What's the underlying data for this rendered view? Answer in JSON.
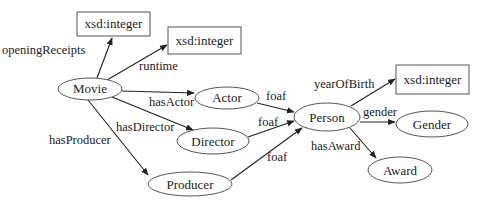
{
  "diagram": {
    "nodes": {
      "xsd1": {
        "label": "xsd:integer",
        "shape": "rect",
        "x": 77,
        "y": 12,
        "w": 73,
        "h": 24
      },
      "xsd2": {
        "label": "xsd:integer",
        "shape": "rect",
        "x": 168,
        "y": 27,
        "w": 73,
        "h": 27
      },
      "movie": {
        "label": "Movie",
        "shape": "ellipse",
        "cx": 90,
        "cy": 89,
        "rx": 32,
        "ry": 11
      },
      "actor": {
        "label": "Actor",
        "shape": "ellipse",
        "cx": 227,
        "cy": 98,
        "rx": 32,
        "ry": 11
      },
      "director": {
        "label": "Director",
        "shape": "ellipse",
        "cx": 213,
        "cy": 141,
        "rx": 36,
        "ry": 13
      },
      "producer": {
        "label": "Producer",
        "shape": "ellipse",
        "cx": 190,
        "cy": 184,
        "rx": 42,
        "ry": 12
      },
      "person": {
        "label": "Person",
        "shape": "ellipse",
        "cx": 327,
        "cy": 117,
        "rx": 33,
        "ry": 14
      },
      "xsd3": {
        "label": "xsd:integer",
        "shape": "rect",
        "x": 396,
        "y": 65,
        "w": 73,
        "h": 29
      },
      "gender": {
        "label": "Gender",
        "shape": "ellipse",
        "cx": 432,
        "cy": 124,
        "rx": 36,
        "ry": 13
      },
      "award": {
        "label": "Award",
        "shape": "ellipse",
        "cx": 400,
        "cy": 170,
        "rx": 32,
        "ry": 13
      }
    },
    "edges": {
      "openingReceipts": {
        "label": "openingReceipts",
        "from": "Movie",
        "to": "xsd:integer"
      },
      "runtime": {
        "label": "runtime",
        "from": "Movie",
        "to": "xsd:integer"
      },
      "hasActor": {
        "label": "hasActor",
        "from": "Movie",
        "to": "Actor"
      },
      "hasDirector": {
        "label": "hasDirector",
        "from": "Movie",
        "to": "Director"
      },
      "hasProducer": {
        "label": "hasProducer",
        "from": "Movie",
        "to": "Producer"
      },
      "foafActor": {
        "label": "foaf",
        "from": "Actor",
        "to": "Person"
      },
      "foafDirector": {
        "label": "foaf",
        "from": "Director",
        "to": "Person"
      },
      "foafProducer": {
        "label": "foaf",
        "from": "Producer",
        "to": "Person"
      },
      "yearOfBirth": {
        "label": "yearOfBirth",
        "from": "Person",
        "to": "xsd:integer"
      },
      "gender": {
        "label": "gender",
        "from": "Person",
        "to": "Gender"
      },
      "hasAward": {
        "label": "hasAward",
        "from": "Person",
        "to": "Award"
      }
    },
    "colors": {
      "background": "#ffffff",
      "stroke": "#555555",
      "text": "#222222"
    }
  }
}
